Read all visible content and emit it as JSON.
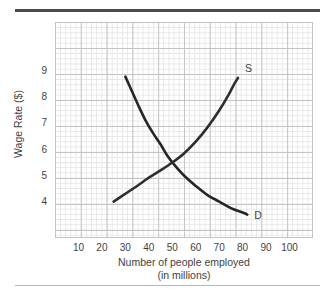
{
  "figure": {
    "top_rule_color": "#4a4a4a",
    "bottom_rule_color": "#b9b9b9"
  },
  "chart_data": {
    "type": "line",
    "title": "",
    "xlabel": "Number of people employed",
    "xlabel_sub": "(in millions)",
    "ylabel": "Wage Rate ($)",
    "xlim": [
      0,
      110
    ],
    "ylim": [
      2.6,
      10.9
    ],
    "xticks": [
      10,
      20,
      30,
      40,
      50,
      60,
      70,
      80,
      90,
      100
    ],
    "xtick_labels": [
      "10",
      "20",
      "30",
      "40",
      "50",
      "60",
      "70",
      "80",
      "90",
      "100"
    ],
    "yticks": [
      4,
      5,
      6,
      7,
      8,
      9
    ],
    "ytick_labels": [
      "4",
      "5",
      "6",
      "7",
      "8",
      "9"
    ],
    "grid": "on",
    "grid_minor": "on",
    "legend": "curve-end-labels",
    "equilibrium": {
      "x": 50,
      "y": 5.4
    },
    "series": [
      {
        "name": "D",
        "label": "D",
        "description": "Demand curve, downward sloping convex",
        "color": "#252525",
        "line_width": 2.6,
        "label_position": {
          "x": 85,
          "y": 3.45
        },
        "points": [
          {
            "x": 30,
            "y": 8.8
          },
          {
            "x": 33,
            "y": 8.2
          },
          {
            "x": 36,
            "y": 7.6
          },
          {
            "x": 39,
            "y": 7.05
          },
          {
            "x": 42,
            "y": 6.6
          },
          {
            "x": 45,
            "y": 6.2
          },
          {
            "x": 48,
            "y": 5.75
          },
          {
            "x": 51,
            "y": 5.4
          },
          {
            "x": 55,
            "y": 5.0
          },
          {
            "x": 60,
            "y": 4.6
          },
          {
            "x": 65,
            "y": 4.25
          },
          {
            "x": 70,
            "y": 4.0
          },
          {
            "x": 75,
            "y": 3.75
          },
          {
            "x": 80,
            "y": 3.58
          },
          {
            "x": 82,
            "y": 3.5
          }
        ]
      },
      {
        "name": "S",
        "label": "S",
        "description": "Supply curve, upward sloping convex",
        "color": "#2e2e2e",
        "line_width": 2.6,
        "label_position": {
          "x": 81,
          "y": 9.1
        },
        "points": [
          {
            "x": 25,
            "y": 4.0
          },
          {
            "x": 30,
            "y": 4.3
          },
          {
            "x": 35,
            "y": 4.6
          },
          {
            "x": 40,
            "y": 4.92
          },
          {
            "x": 45,
            "y": 5.2
          },
          {
            "x": 50,
            "y": 5.5
          },
          {
            "x": 55,
            "y": 5.85
          },
          {
            "x": 60,
            "y": 6.3
          },
          {
            "x": 65,
            "y": 6.85
          },
          {
            "x": 70,
            "y": 7.5
          },
          {
            "x": 74,
            "y": 8.1
          },
          {
            "x": 76,
            "y": 8.45
          },
          {
            "x": 78,
            "y": 8.75
          }
        ]
      }
    ]
  }
}
